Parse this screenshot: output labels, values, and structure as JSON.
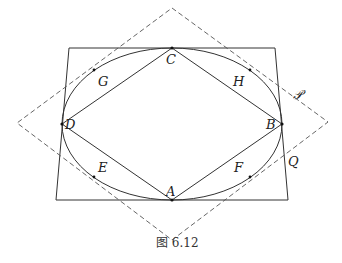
{
  "figure": {
    "caption": "图 6.12",
    "colors": {
      "stroke": "#333333",
      "dashed": "#555555",
      "background": "#ffffff"
    },
    "points": {
      "A": "A",
      "B": "B",
      "C": "C",
      "D": "D",
      "E": "E",
      "F": "F",
      "G": "G",
      "H": "H"
    },
    "curves": {
      "P": "𝒫",
      "Q": "Q"
    }
  }
}
